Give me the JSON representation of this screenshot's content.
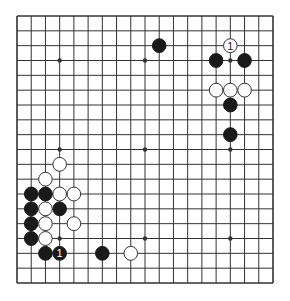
{
  "game": {
    "type": "go",
    "board_size": 19,
    "colors": {
      "background": "#ffffff",
      "line": "#333333",
      "black_stone": "#1a1a1a",
      "white_stone": "#ffffff",
      "white_stone_border": "#333333",
      "label_on_black": "#ffffff",
      "label_on_white": "#222222"
    },
    "star_points": [
      [
        3,
        3
      ],
      [
        9,
        3
      ],
      [
        15,
        3
      ],
      [
        3,
        9
      ],
      [
        9,
        9
      ],
      [
        15,
        9
      ],
      [
        3,
        15
      ],
      [
        9,
        15
      ],
      [
        15,
        15
      ]
    ],
    "stones": [
      {
        "col": 10,
        "row": 2,
        "color": "black",
        "label": ""
      },
      {
        "col": 14,
        "row": 3,
        "color": "black",
        "label": ""
      },
      {
        "col": 16,
        "row": 3,
        "color": "black",
        "label": ""
      },
      {
        "col": 15,
        "row": 6,
        "color": "black",
        "label": ""
      },
      {
        "col": 15,
        "row": 8,
        "color": "black",
        "label": ""
      },
      {
        "col": 1,
        "row": 12,
        "color": "black",
        "label": ""
      },
      {
        "col": 2,
        "row": 12,
        "color": "black",
        "label": ""
      },
      {
        "col": 1,
        "row": 13,
        "color": "black",
        "label": ""
      },
      {
        "col": 3,
        "row": 13,
        "color": "black",
        "label": ""
      },
      {
        "col": 1,
        "row": 14,
        "color": "black",
        "label": ""
      },
      {
        "col": 1,
        "row": 15,
        "color": "black",
        "label": ""
      },
      {
        "col": 2,
        "row": 16,
        "color": "black",
        "label": ""
      },
      {
        "col": 3,
        "row": 16,
        "color": "black",
        "label": "1"
      },
      {
        "col": 6,
        "row": 16,
        "color": "black",
        "label": ""
      },
      {
        "col": 15,
        "row": 2,
        "color": "white",
        "label": "1"
      },
      {
        "col": 14,
        "row": 5,
        "color": "white",
        "label": ""
      },
      {
        "col": 15,
        "row": 5,
        "color": "white",
        "label": ""
      },
      {
        "col": 16,
        "row": 5,
        "color": "white",
        "label": ""
      },
      {
        "col": 3,
        "row": 10,
        "color": "white",
        "label": ""
      },
      {
        "col": 2,
        "row": 11,
        "color": "white",
        "label": ""
      },
      {
        "col": 3,
        "row": 12,
        "color": "white",
        "label": ""
      },
      {
        "col": 4,
        "row": 12,
        "color": "white",
        "label": ""
      },
      {
        "col": 2,
        "row": 13,
        "color": "white",
        "label": ""
      },
      {
        "col": 2,
        "row": 14,
        "color": "white",
        "label": ""
      },
      {
        "col": 4,
        "row": 14,
        "color": "white",
        "label": ""
      },
      {
        "col": 2,
        "row": 15,
        "color": "white",
        "label": ""
      },
      {
        "col": 8,
        "row": 16,
        "color": "white",
        "label": ""
      }
    ]
  }
}
